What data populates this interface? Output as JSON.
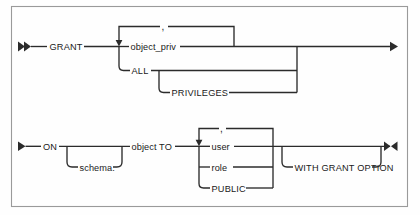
{
  "diagram": {
    "kind": "railroad-syntax-diagram",
    "frame": {
      "border_color": "#9a9a9a",
      "background": "#fefefe"
    },
    "line_color": "#2b2b2b",
    "text_color": "#1a1a1a",
    "start_marker": "double-right-arrow",
    "continue_marker": "single-right-arrow",
    "end_marker": "right-left-arrow-pair",
    "rows": [
      {
        "id": "row-1",
        "entry_marker": "►►",
        "exit_marker": "►",
        "tokens": [
          {
            "id": "grant",
            "label": "GRANT",
            "type": "keyword"
          },
          {
            "id": "object_priv",
            "label": "object_priv",
            "type": "placeholder"
          },
          {
            "id": "all",
            "label": "ALL",
            "type": "keyword"
          },
          {
            "id": "privileges",
            "label": "PRIVILEGES",
            "type": "keyword",
            "optional": true
          }
        ],
        "repeat_separator": ","
      },
      {
        "id": "row-2",
        "entry_marker": "►",
        "exit_marker": "►◄",
        "tokens": [
          {
            "id": "on",
            "label": "ON",
            "type": "keyword"
          },
          {
            "id": "schema",
            "label": "schema.",
            "type": "placeholder",
            "optional": true
          },
          {
            "id": "object_to",
            "label": "object TO",
            "type": "mixed"
          },
          {
            "id": "user",
            "label": "user",
            "type": "placeholder"
          },
          {
            "id": "role",
            "label": "role",
            "type": "placeholder"
          },
          {
            "id": "public",
            "label": "PUBLIC",
            "type": "keyword"
          },
          {
            "id": "with_grant_option",
            "label": "WITH GRANT OPTION",
            "type": "keyword",
            "optional": true
          }
        ],
        "repeat_separator": ","
      }
    ],
    "labels": {
      "grant": "GRANT",
      "object_priv": "object_priv",
      "all": "ALL",
      "privileges": "PRIVILEGES",
      "comma_top": ",",
      "on": "ON",
      "schema": "schema.",
      "object_to": "object TO",
      "user": "user",
      "role": "role",
      "public": "PUBLIC",
      "with_grant_option": "WITH GRANT OPTION",
      "comma_bottom": ","
    }
  }
}
